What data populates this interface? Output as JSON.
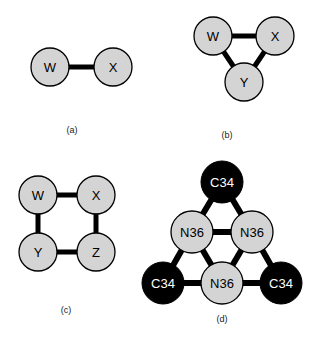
{
  "figure": {
    "colors": {
      "background": "#ffffff",
      "node_gray_fill": "#d4d4d4",
      "node_black_fill": "#000000",
      "node_stroke": "#000000",
      "edge": "#000000",
      "label_dark": "#000000",
      "label_light": "#ffffff",
      "caption": "#222222"
    },
    "node_radius_small": 19,
    "node_radius_large": 21,
    "edge_width_thin": 4,
    "edge_width_thick": 6
  },
  "panels": [
    {
      "id": "panel-a",
      "caption": "(a)",
      "caption_x": 72,
      "caption_y": 133,
      "nodes": [
        {
          "id": "a-w",
          "label": "W",
          "cx": 50,
          "cy": 67,
          "r": 19,
          "fill": "gray",
          "font_size": 13
        },
        {
          "id": "a-x",
          "label": "X",
          "cx": 113,
          "cy": 67,
          "r": 19,
          "fill": "gray",
          "font_size": 13
        }
      ],
      "edges": [
        {
          "id": "a-edge-wx",
          "from": "a-w",
          "to": "a-x",
          "width": 5
        }
      ]
    },
    {
      "id": "panel-b",
      "caption": "(b)",
      "caption_x": 227,
      "caption_y": 138,
      "nodes": [
        {
          "id": "b-w",
          "label": "W",
          "cx": 213,
          "cy": 36,
          "r": 19,
          "fill": "gray",
          "font_size": 13
        },
        {
          "id": "b-x",
          "label": "X",
          "cx": 275,
          "cy": 36,
          "r": 19,
          "fill": "gray",
          "font_size": 13
        },
        {
          "id": "b-y",
          "label": "Y",
          "cx": 244,
          "cy": 82,
          "r": 19,
          "fill": "gray",
          "font_size": 13
        }
      ],
      "edges": [
        {
          "id": "b-edge-wx",
          "from": "b-w",
          "to": "b-x",
          "width": 5
        },
        {
          "id": "b-edge-wy",
          "from": "b-w",
          "to": "b-y",
          "width": 5
        },
        {
          "id": "b-edge-xy",
          "from": "b-x",
          "to": "b-y",
          "width": 5
        }
      ]
    },
    {
      "id": "panel-c",
      "caption": "(c)",
      "caption_x": 66,
      "caption_y": 313,
      "nodes": [
        {
          "id": "c-w",
          "label": "W",
          "cx": 38,
          "cy": 195,
          "r": 19,
          "fill": "gray",
          "font_size": 13
        },
        {
          "id": "c-x",
          "label": "X",
          "cx": 96,
          "cy": 195,
          "r": 19,
          "fill": "gray",
          "font_size": 13
        },
        {
          "id": "c-y",
          "label": "Y",
          "cx": 38,
          "cy": 252,
          "r": 19,
          "fill": "gray",
          "font_size": 13
        },
        {
          "id": "c-z",
          "label": "Z",
          "cx": 96,
          "cy": 252,
          "r": 19,
          "fill": "gray",
          "font_size": 13
        }
      ],
      "edges": [
        {
          "id": "c-edge-wx",
          "from": "c-w",
          "to": "c-x",
          "width": 5
        },
        {
          "id": "c-edge-wy",
          "from": "c-w",
          "to": "c-y",
          "width": 5
        },
        {
          "id": "c-edge-xz",
          "from": "c-x",
          "to": "c-z",
          "width": 5
        },
        {
          "id": "c-edge-yz",
          "from": "c-y",
          "to": "c-z",
          "width": 5
        }
      ]
    },
    {
      "id": "panel-d",
      "caption": "(d)",
      "caption_x": 222,
      "caption_y": 322,
      "nodes": [
        {
          "id": "d-top",
          "label": "C34",
          "cx": 222,
          "cy": 182,
          "r": 21,
          "fill": "black",
          "font_size": 13
        },
        {
          "id": "d-midleft",
          "label": "N36",
          "cx": 192,
          "cy": 232,
          "r": 21,
          "fill": "gray",
          "font_size": 13
        },
        {
          "id": "d-midright",
          "label": "N36",
          "cx": 252,
          "cy": 232,
          "r": 21,
          "fill": "gray",
          "font_size": 13
        },
        {
          "id": "d-botleft",
          "label": "C34",
          "cx": 163,
          "cy": 283,
          "r": 21,
          "fill": "black",
          "font_size": 13
        },
        {
          "id": "d-botmid",
          "label": "N36",
          "cx": 222,
          "cy": 283,
          "r": 21,
          "fill": "gray",
          "font_size": 13
        },
        {
          "id": "d-botright",
          "label": "C34",
          "cx": 281,
          "cy": 283,
          "r": 21,
          "fill": "black",
          "font_size": 13
        }
      ],
      "edges": [
        {
          "id": "d-edge-top-midleft",
          "from": "d-top",
          "to": "d-midleft",
          "width": 6
        },
        {
          "id": "d-edge-top-midright",
          "from": "d-top",
          "to": "d-midright",
          "width": 6
        },
        {
          "id": "d-edge-midleft-midright",
          "from": "d-midleft",
          "to": "d-midright",
          "width": 6
        },
        {
          "id": "d-edge-midleft-botleft",
          "from": "d-midleft",
          "to": "d-botleft",
          "width": 6
        },
        {
          "id": "d-edge-midleft-botmid",
          "from": "d-midleft",
          "to": "d-botmid",
          "width": 6
        },
        {
          "id": "d-edge-midright-botmid",
          "from": "d-midright",
          "to": "d-botmid",
          "width": 6
        },
        {
          "id": "d-edge-midright-botright",
          "from": "d-midright",
          "to": "d-botright",
          "width": 6
        },
        {
          "id": "d-edge-botleft-botmid",
          "from": "d-botleft",
          "to": "d-botmid",
          "width": 6
        },
        {
          "id": "d-edge-botmid-botright",
          "from": "d-botmid",
          "to": "d-botright",
          "width": 6
        }
      ]
    }
  ]
}
